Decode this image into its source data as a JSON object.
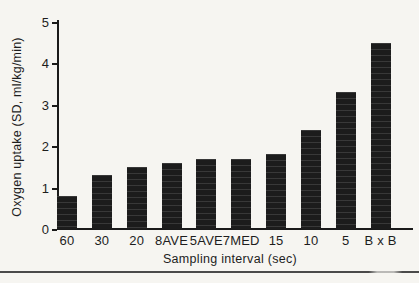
{
  "chart_data": {
    "type": "bar",
    "xlabel": "Sampling interval (sec)",
    "ylabel": "Oxygen uptake (SD, ml/kg/min)",
    "categories": [
      "60",
      "30",
      "20",
      "8AVE",
      "5AVE",
      "7MED",
      "15",
      "10",
      "5",
      "B x B"
    ],
    "values": [
      0.8,
      1.3,
      1.5,
      1.6,
      1.7,
      1.7,
      1.8,
      2.4,
      3.3,
      4.5
    ],
    "ylim": [
      0,
      5
    ],
    "yticks": [
      0,
      1,
      2,
      3,
      4,
      5
    ],
    "grid": false,
    "legend": "none"
  },
  "colors": {
    "bar": "#1c1c1c",
    "axis": "#1a1a1a",
    "text": "#1d1d1d",
    "background": "#f6f5f1",
    "divider": "#4a4a4a"
  }
}
